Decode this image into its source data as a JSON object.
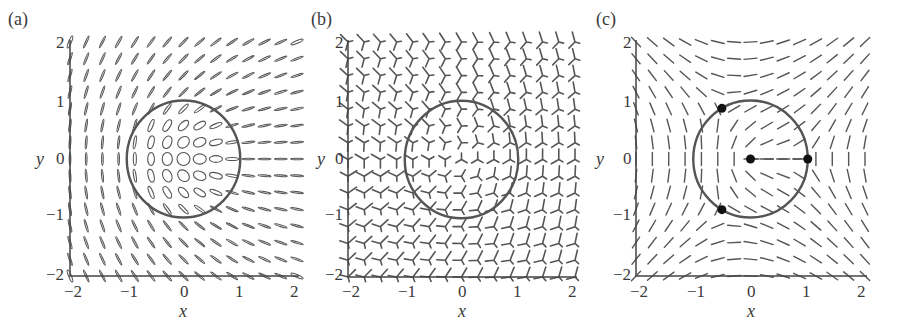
{
  "chart_data": [
    {
      "type": "scatter",
      "subtype": "director-field-ellipses",
      "panel_label": "(a)",
      "title": "",
      "xlabel": "x",
      "ylabel": "y",
      "xlim": [
        -2,
        2
      ],
      "ylim": [
        -2,
        2
      ],
      "xticks": [
        -2,
        -1,
        0,
        1,
        2
      ],
      "yticks": [
        -2,
        -1,
        0,
        1,
        2
      ],
      "xtick_labels": [
        "−2",
        "−1",
        "0",
        "1",
        "2"
      ],
      "ytick_labels": [
        "−2",
        "−1",
        "0",
        "1",
        "2"
      ],
      "grid": false,
      "glyph": "ellipse",
      "grid_points_per_axis": 15,
      "orientation_model": "phi = arg(z)/2",
      "circle": {
        "cx": 0,
        "cy": 0,
        "r": 1
      },
      "points": []
    },
    {
      "type": "scatter",
      "subtype": "director-field-trefoil-glyphs",
      "panel_label": "(b)",
      "title": "",
      "xlabel": "x",
      "ylabel": "y",
      "xlim": [
        -2,
        2
      ],
      "ylim": [
        -2,
        2
      ],
      "xticks": [
        -2,
        -1,
        0,
        1,
        2
      ],
      "yticks": [
        -2,
        -1,
        0,
        1,
        2
      ],
      "xtick_labels": [
        "−2",
        "−1",
        "0",
        "1",
        "2"
      ],
      "ytick_labels": [
        "−2",
        "−1",
        "0",
        "1",
        "2"
      ],
      "grid": false,
      "glyph": "three-armed",
      "grid_points_per_axis": 15,
      "orientation_model": "phi = arg(z)/3",
      "circle": {
        "cx": 0,
        "cy": 0,
        "r": 1
      },
      "points": []
    },
    {
      "type": "scatter",
      "subtype": "director-field-lines",
      "panel_label": "(c)",
      "title": "",
      "xlabel": "x",
      "ylabel": "y",
      "xlim": [
        -2,
        2
      ],
      "ylim": [
        -2,
        2
      ],
      "xticks": [
        -2,
        -1,
        0,
        1,
        2
      ],
      "yticks": [
        -2,
        -1,
        0,
        1,
        2
      ],
      "xtick_labels": [
        "−2",
        "−1",
        "0",
        "1",
        "2"
      ],
      "ytick_labels": [
        "−2",
        "−1",
        "0",
        "1",
        "2"
      ],
      "grid": false,
      "glyph": "line",
      "grid_points_per_axis": 15,
      "orientation_model": "phi = pi/2 + arg(z)/2 - sum_k arg(z - z_k)/2",
      "circle": {
        "cx": 0,
        "cy": 0,
        "r": 1
      },
      "points": [
        {
          "x": 0,
          "y": 0
        },
        {
          "x": 1,
          "y": 0
        },
        {
          "x": -0.5,
          "y": 0.866
        },
        {
          "x": -0.5,
          "y": -0.866
        }
      ],
      "dashed_segment": {
        "from": [
          0,
          0
        ],
        "to": [
          1,
          0
        ]
      }
    }
  ],
  "style": {
    "ink": "#555555",
    "axis": "#444444",
    "circle": "#555555",
    "dot": "#111111",
    "text": "#3a3a3a"
  }
}
